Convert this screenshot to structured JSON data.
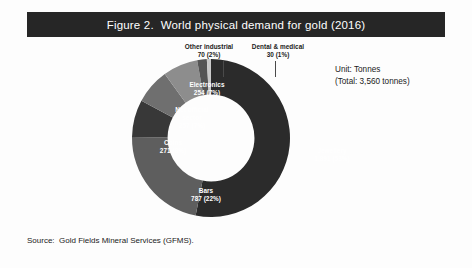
{
  "figure": {
    "title": "Figure 2.  World physical demand for gold (2016)",
    "source": "Source:  Gold Fields Mineral Services (GFMS).",
    "unit_line_1": "Unit: Tonnes",
    "unit_line_2": "(Total: 3,560 tonnes)"
  },
  "labels": {
    "jewellery": "Jewellery\n1,891 (53%)",
    "bars": "Bars\n787 (22%)",
    "coins": "Coins\n271 (8%)",
    "net_official_sector": "Net official\nsector\n257 (7%)",
    "electronics": "Electronics\n254 (7%)",
    "other_industrial": "Other industrial\n70 (2%)",
    "dental_medical": "Dental & medical\n30 (1%)"
  },
  "chart_data": {
    "type": "pie",
    "variant": "donut",
    "title": "Figure 2.  World physical demand for gold (2016)",
    "unit": "Tonnes",
    "total": 3560,
    "total_label": "(Total: 3,560 tonnes)",
    "start_angle_deg": 0,
    "direction": "clockwise",
    "inner_radius_ratio": 0.55,
    "legend": "none (direct labels)",
    "grid": false,
    "categories": [
      "Jewellery",
      "Bars",
      "Coins",
      "Net official sector",
      "Electronics",
      "Other industrial",
      "Dental & medical"
    ],
    "values": [
      1891,
      787,
      271,
      257,
      254,
      70,
      30
    ],
    "percentages": [
      53,
      22,
      8,
      7,
      7,
      2,
      1
    ],
    "colors": [
      "#2b2b2b",
      "#5e5e5e",
      "#383838",
      "#6f6f6f",
      "#8d8d8d",
      "#555555",
      "#c9c9c9"
    ],
    "slices": [
      {
        "name": "Jewellery",
        "value": 1891,
        "percent": 53,
        "color": "#2b2b2b",
        "label": "Jewellery 1,891 (53%)"
      },
      {
        "name": "Bars",
        "value": 787,
        "percent": 22,
        "color": "#5e5e5e",
        "label": "Bars 787 (22%)"
      },
      {
        "name": "Coins",
        "value": 271,
        "percent": 8,
        "color": "#383838",
        "label": "Coins 271 (8%)"
      },
      {
        "name": "Net official sector",
        "value": 257,
        "percent": 7,
        "color": "#6f6f6f",
        "label": "Net official sector 257 (7%)"
      },
      {
        "name": "Electronics",
        "value": 254,
        "percent": 7,
        "color": "#8d8d8d",
        "label": "Electronics 254 (7%)"
      },
      {
        "name": "Other industrial",
        "value": 70,
        "percent": 2,
        "color": "#555555",
        "label": "Other industrial 70 (2%)"
      },
      {
        "name": "Dental & medical",
        "value": 30,
        "percent": 1,
        "color": "#c9c9c9",
        "label": "Dental & medical 30 (1%)"
      }
    ]
  },
  "style": {
    "title_bar_bg": "#262626",
    "title_text_color": "#ffffff",
    "page_bg": "#fdfdfd",
    "donut_hole_color": "#ffffff"
  }
}
